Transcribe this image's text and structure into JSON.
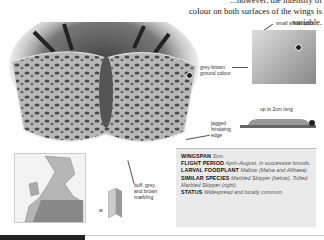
{
  "intro_text": {
    "line1": "...however, the intensity of",
    "line2": "colour on both surfaces of the wings is variable."
  },
  "labels": {
    "small_white_spots": "small white spots",
    "grey_brown": "grey-brown",
    "ground_colour": "ground colour",
    "caterpillar_length": "up to 2cm long",
    "jagged1": "jagged",
    "jagged2": "hindwing",
    "jagged3": "edge",
    "marbling1": "buff, grey,",
    "marbling2": "and brown",
    "marbling3": "marbling"
  },
  "info_box": {
    "wingspan_label": "WINGSPAN",
    "wingspan_value": "3cm.",
    "flight_label": "FLIGHT PERIOD",
    "flight_value": "April–August, in successive broods.",
    "foodplant_label": "LARVAL FOODPLANT",
    "foodplant_value": "Mallow (Malva and Althaea).",
    "similar_label": "SIMILAR SPECIES",
    "similar_value": "Marbled Skipper (below), Tufted Marbled Skipper (right).",
    "status_label": "STATUS",
    "status_value": "Widespread and locally common."
  },
  "icons": {
    "male_symbol": "♂",
    "flight_symbol": "ʍ"
  },
  "colors": {
    "info_bg": "#eaeaea",
    "text": "#222222"
  }
}
